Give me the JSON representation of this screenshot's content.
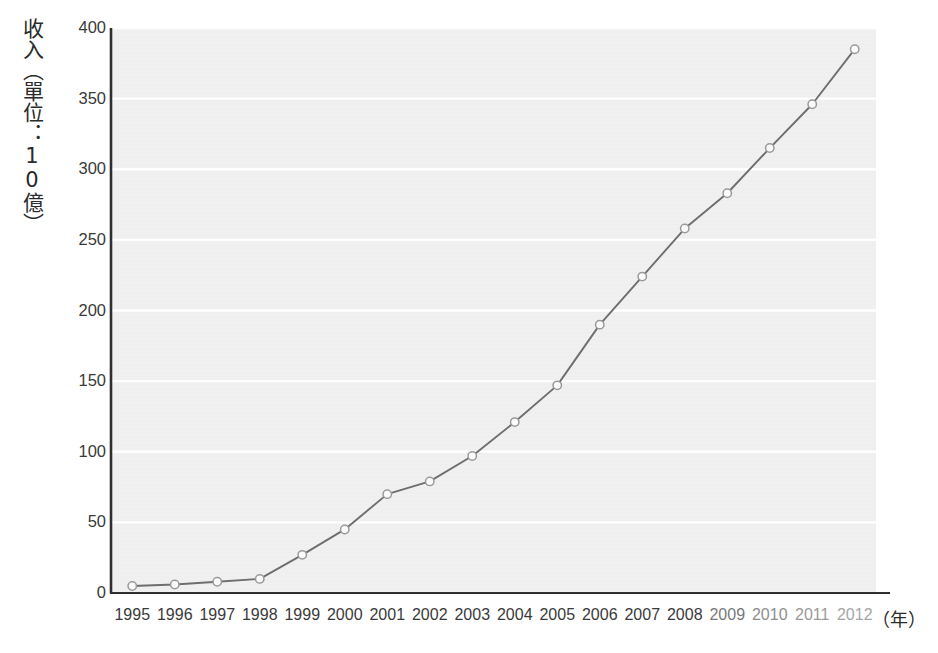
{
  "chart_data": {
    "type": "line",
    "title": "",
    "subtitle": "",
    "xlabel": "（年）",
    "ylabel": "收入（單位：10億）",
    "categories": [
      "1995",
      "1996",
      "1997",
      "1998",
      "1999",
      "2000",
      "2001",
      "2002",
      "2003",
      "2004",
      "2005",
      "2006",
      "2007",
      "2008",
      "2009",
      "2010",
      "2011",
      "2012"
    ],
    "values": [
      5,
      6,
      8,
      10,
      27,
      45,
      70,
      79,
      97,
      121,
      147,
      190,
      224,
      258,
      283,
      315,
      346,
      385
    ],
    "series": [
      {
        "name": "收入",
        "values": [
          5,
          6,
          8,
          10,
          27,
          45,
          70,
          79,
          97,
          121,
          147,
          190,
          224,
          258,
          283,
          315,
          346,
          385
        ]
      }
    ],
    "ylim": [
      0,
      400
    ],
    "y_ticks": [
      0,
      50,
      100,
      150,
      200,
      250,
      300,
      350,
      400
    ],
    "y_tick_labels": [
      "0",
      "50",
      "100",
      "150",
      "200",
      "250",
      "300",
      "350",
      "400"
    ],
    "x_tick_labels": [
      "1995",
      "1996",
      "1997",
      "1998",
      "1999",
      "2000",
      "2001",
      "2002",
      "2003",
      "2004",
      "2005",
      "2006",
      "2007",
      "2008",
      "2009",
      "2010",
      "2011",
      "2012"
    ],
    "grid": true,
    "grid_orientation": "horizontal",
    "legend": false,
    "legend_position": "none",
    "marker": "open-circle",
    "annotations": []
  },
  "axes": {
    "y_title": "收入（單位：10億）",
    "x_title": "（年）"
  },
  "style": {
    "plot_background": "#f0f0f0",
    "page_background": "#ffffff",
    "grid_color": "#ffffff",
    "line_color": "#6e6e6e",
    "marker_fill": "#fbfbfb",
    "marker_stroke": "#9a9a9a",
    "axis_color": "#2f2f2f",
    "tick_text_color": "#3a3a3a"
  }
}
